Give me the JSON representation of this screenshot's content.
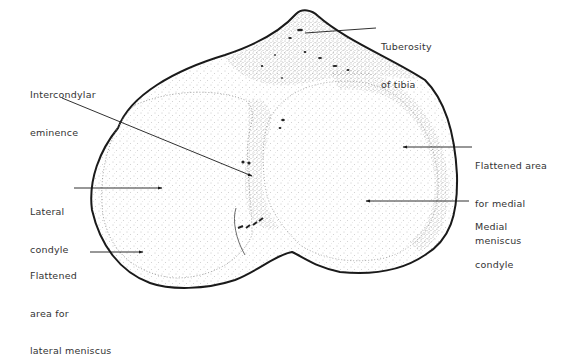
{
  "figure": {
    "colors": {
      "ink": "#1a1a1a",
      "text": "#333333",
      "background": "#ffffff",
      "stipple": "#7a7a7a"
    }
  },
  "labels": {
    "tuberosity": {
      "line1": "Tuberosity",
      "line2": "of tibia"
    },
    "intercondylar": {
      "line1": "Intercondylar",
      "line2": "eminence"
    },
    "lateral_condyle": {
      "line1": "Lateral",
      "line2": "condyle"
    },
    "flattened_lateral": {
      "line1": "Flattened",
      "line2": "area for",
      "line3": "lateral meniscus"
    },
    "flattened_medial": {
      "line1": "Flattened area",
      "line2": "for medial",
      "line3": "meniscus"
    },
    "medial_condyle": {
      "line1": "Medial",
      "line2": "condyle"
    }
  }
}
